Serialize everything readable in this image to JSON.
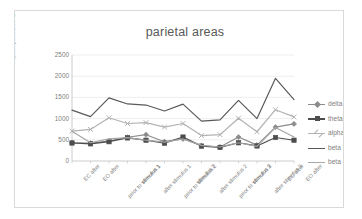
{
  "chart_data": {
    "type": "line",
    "title": "parietal areas",
    "xlabel": "",
    "ylabel": "rhythm power, uV^2",
    "ylim": [
      0,
      2500
    ],
    "yticks": [
      0,
      500,
      1000,
      1500,
      2000,
      2500
    ],
    "ytick_labels": [
      "0",
      "500",
      "1000",
      "1500",
      "2000",
      "2500"
    ],
    "grid": true,
    "legend_position": "right",
    "categories": [
      "EC after",
      "EO after",
      "prior to stimulus 1",
      "stimulus 1",
      "after stimulus 1",
      "prior to stimulus 2",
      "stimulus 2",
      "after stimulus 2",
      "prior to stimulus 3",
      "stimulus 3",
      "after stimulus 3",
      "EC after",
      "EO after"
    ],
    "series": [
      {
        "name": "delta",
        "color": "#8c8c8c",
        "marker": "diamond",
        "values": [
          430,
          420,
          470,
          560,
          620,
          455,
          520,
          365,
          330,
          565,
          375,
          800,
          875
        ]
      },
      {
        "name": "theta",
        "color": "#4d4d4d",
        "marker": "square",
        "values": [
          425,
          405,
          455,
          545,
          490,
          420,
          565,
          350,
          320,
          430,
          355,
          555,
          490
        ]
      },
      {
        "name": "alpha",
        "color": "#b3b3b3",
        "marker": "cross",
        "values": [
          705,
          745,
          1020,
          885,
          905,
          800,
          885,
          600,
          620,
          1010,
          690,
          1210,
          1040
        ]
      },
      {
        "name": "beta 1",
        "color": "#595959",
        "marker": "none",
        "values": [
          1200,
          1045,
          1490,
          1345,
          1320,
          1180,
          1340,
          940,
          970,
          1430,
          1000,
          1950,
          1450
        ]
      },
      {
        "name": "beta 2",
        "color": "#a6a6a6",
        "marker": "none",
        "values": [
          700,
          430,
          520,
          550,
          490,
          445,
          520,
          370,
          330,
          430,
          345,
          790,
          565
        ]
      }
    ]
  }
}
